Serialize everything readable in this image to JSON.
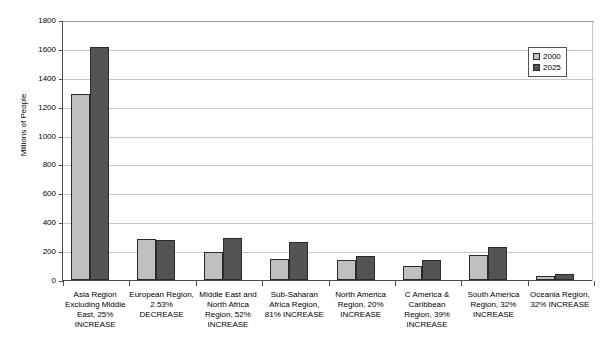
{
  "chart_data": {
    "type": "bar",
    "title": "",
    "xlabel": "",
    "ylabel": "Millions of People",
    "ylim": [
      0,
      1800
    ],
    "ytick_step": 200,
    "yticks": [
      0,
      200,
      400,
      600,
      800,
      1000,
      1200,
      1400,
      1600,
      1800
    ],
    "grid": true,
    "legend_position": "top-right",
    "categories": [
      "Asia Region Excluding Middle East, 25% INCREASE",
      "European Region, 2.53% DECREASE",
      "Middle East and North Africa Region, 52% INCREASE",
      "Sub-Saharan Africa Region, 81% INCREASE",
      "North America Region, 20% INCREASE",
      "C America & Caribbean Region, 39% INCREASE",
      "South America Region, 32% INCREASE",
      "Oceania Region, 32% INCREASE"
    ],
    "series": [
      {
        "name": "2000",
        "color": "#c0c0c0",
        "values": [
          1290,
          285,
          195,
          145,
          140,
          100,
          175,
          31
        ]
      },
      {
        "name": "2025",
        "color": "#545454",
        "values": [
          1613,
          278,
          290,
          262,
          167,
          138,
          231,
          41
        ]
      }
    ]
  },
  "legend": {
    "entries": [
      {
        "label": "2000"
      },
      {
        "label": "2025"
      }
    ]
  },
  "axis": {
    "y_title": "Millions of People"
  }
}
